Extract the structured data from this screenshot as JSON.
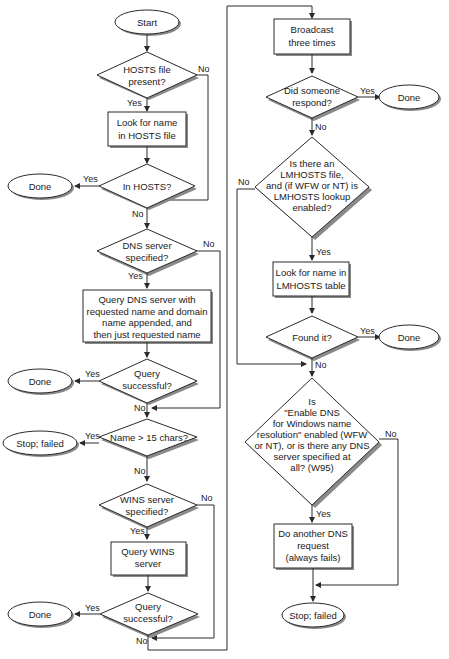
{
  "diagram": {
    "type": "flowchart",
    "nodes": {
      "start": {
        "kind": "terminal",
        "text": [
          "Start"
        ]
      },
      "hosts_present": {
        "kind": "decision",
        "text": [
          "HOSTS file",
          "present?"
        ]
      },
      "look_hosts": {
        "kind": "process",
        "text": [
          "Look for name",
          "in HOSTS file"
        ]
      },
      "in_hosts": {
        "kind": "decision",
        "text": [
          "In HOSTS?"
        ]
      },
      "done1": {
        "kind": "terminal",
        "text": [
          "Done"
        ]
      },
      "dns_specified": {
        "kind": "decision",
        "text": [
          "DNS server",
          "specified?"
        ]
      },
      "query_dns": {
        "kind": "process",
        "text": [
          "Query DNS server with",
          "requested name and domain",
          "name appended, and",
          "then just requested name"
        ]
      },
      "dns_success": {
        "kind": "decision",
        "text": [
          "Query",
          "successful?"
        ]
      },
      "done2": {
        "kind": "terminal",
        "text": [
          "Done"
        ]
      },
      "name_15": {
        "kind": "decision",
        "text": [
          "Name > 15 chars?"
        ]
      },
      "stop1": {
        "kind": "terminal",
        "text": [
          "Stop; failed"
        ]
      },
      "wins_specified": {
        "kind": "decision",
        "text": [
          "WINS server",
          "specified?"
        ]
      },
      "query_wins": {
        "kind": "process",
        "text": [
          "Query WINS",
          "server"
        ]
      },
      "wins_success": {
        "kind": "decision",
        "text": [
          "Query",
          "successful?"
        ]
      },
      "done3": {
        "kind": "terminal",
        "text": [
          "Done"
        ]
      },
      "broadcast": {
        "kind": "process",
        "text": [
          "Broadcast",
          "three times"
        ]
      },
      "responded": {
        "kind": "decision",
        "text": [
          "Did someone",
          "respond?"
        ]
      },
      "done4": {
        "kind": "terminal",
        "text": [
          "Done"
        ]
      },
      "lmhosts": {
        "kind": "decision",
        "text": [
          "Is there an",
          "LMHOSTS file,",
          "and (if WFW or NT) is",
          "LMHOSTS lookup",
          "enabled?"
        ]
      },
      "look_lmhosts": {
        "kind": "process",
        "text": [
          "Look for name in",
          "LMHOSTS table"
        ]
      },
      "found": {
        "kind": "decision",
        "text": [
          "Found it?"
        ]
      },
      "done5": {
        "kind": "terminal",
        "text": [
          "Done"
        ]
      },
      "enable_dns": {
        "kind": "decision",
        "text": [
          "Is",
          "\"Enable DNS",
          "for Windows name",
          "resolution\" enabled (WFW",
          "or NT), or is there any DNS",
          "server specified at",
          "all? (W95)"
        ]
      },
      "another_dns": {
        "kind": "process",
        "text": [
          "Do another DNS",
          "request",
          "(always fails)"
        ]
      },
      "stop2": {
        "kind": "terminal",
        "text": [
          "Stop; failed"
        ]
      }
    },
    "labels": {
      "yes": "Yes",
      "no": "No"
    }
  }
}
